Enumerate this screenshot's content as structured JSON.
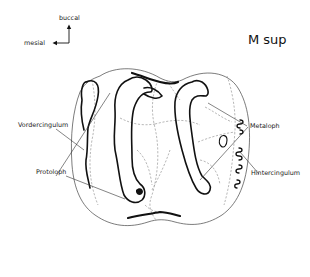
{
  "figure": {
    "title": "M sup",
    "orientation": {
      "up_label": "buccal",
      "left_label": "mesial"
    },
    "labels": {
      "vordercingulum": "Vordercingulum",
      "protoloph": "Protoloph",
      "metaloph": "Metaloph",
      "hintercingulum": "Hintercingulum"
    }
  }
}
